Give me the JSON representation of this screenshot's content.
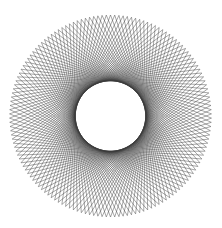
{
  "figure": {
    "type": "string-art chord pattern",
    "background": "#ffffff",
    "stroke_color": "#3a3a3a",
    "center": [
      110.5,
      116
    ],
    "outer_radius": 101,
    "point_count": 150,
    "chord_step": 58,
    "inner_hole_radius_approx": 35
  }
}
